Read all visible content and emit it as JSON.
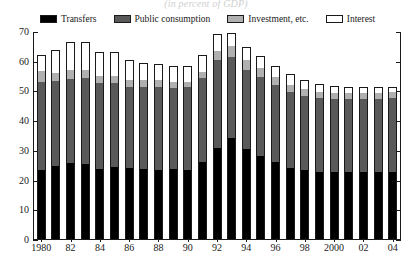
{
  "chart_data": {
    "type": "bar",
    "stacked": true,
    "title": "(in percent of GDP)",
    "xlabel": "",
    "ylabel": "",
    "ylim": [
      0,
      70
    ],
    "yticks": [
      0,
      10,
      20,
      30,
      40,
      50,
      60,
      70
    ],
    "ytick_labels": [
      "0",
      "10",
      "20",
      "30",
      "40",
      "50",
      "60",
      "70"
    ],
    "grid": false,
    "legend_position": "top",
    "categories": [
      "1980",
      "1981",
      "1982",
      "1983",
      "1984",
      "1985",
      "1986",
      "1987",
      "1988",
      "1989",
      "1990",
      "1991",
      "1992",
      "1993",
      "1994",
      "1995",
      "1996",
      "1997",
      "1998",
      "1999",
      "2000",
      "2001",
      "2002",
      "2003",
      "2004"
    ],
    "xtick_labels": [
      {
        "label": "1980",
        "category": "1980"
      },
      {
        "label": "82",
        "category": "1982"
      },
      {
        "label": "84",
        "category": "1984"
      },
      {
        "label": "86",
        "category": "1986"
      },
      {
        "label": "88",
        "category": "1988"
      },
      {
        "label": "90",
        "category": "1990"
      },
      {
        "label": "92",
        "category": "1992"
      },
      {
        "label": "94",
        "category": "1994"
      },
      {
        "label": "96",
        "category": "1996"
      },
      {
        "label": "98",
        "category": "1998"
      },
      {
        "label": "2000",
        "category": "2000"
      },
      {
        "label": "02",
        "category": "2002"
      },
      {
        "label": "04",
        "category": "2004"
      }
    ],
    "series": [
      {
        "name": "Transfers",
        "color": "#000000",
        "values": [
          23.2,
          24.6,
          25.6,
          25.2,
          23.6,
          24.2,
          24.0,
          23.4,
          23.2,
          23.4,
          23.2,
          25.8,
          30.6,
          34.0,
          30.2,
          28.0,
          25.8,
          24.0,
          23.2,
          22.6,
          22.6,
          22.6,
          22.6,
          22.6,
          22.6
        ]
      },
      {
        "name": "Public consumption",
        "color": "#595959",
        "values": [
          29.8,
          28.6,
          28.4,
          29.0,
          29.0,
          28.2,
          27.2,
          27.6,
          27.8,
          27.4,
          27.8,
          28.4,
          29.6,
          27.4,
          26.8,
          26.4,
          26.0,
          25.4,
          25.0,
          24.8,
          24.4,
          24.4,
          24.6,
          24.6,
          24.8
        ]
      },
      {
        "name": "Investment, etc.",
        "color": "#b0b0b0",
        "values": [
          3.4,
          2.8,
          3.0,
          2.6,
          2.4,
          2.4,
          2.4,
          2.6,
          2.4,
          2.2,
          2.0,
          2.0,
          3.2,
          3.4,
          3.2,
          3.0,
          2.6,
          2.4,
          2.2,
          2.0,
          2.0,
          2.0,
          2.0,
          2.0,
          2.0
        ]
      },
      {
        "name": "Interest",
        "color": "#ffffff",
        "values": [
          5.4,
          7.6,
          9.2,
          9.4,
          7.8,
          8.0,
          6.6,
          5.6,
          5.6,
          5.4,
          5.4,
          5.8,
          5.6,
          4.6,
          4.4,
          4.2,
          4.0,
          3.8,
          3.2,
          2.8,
          2.4,
          2.2,
          2.0,
          1.8,
          1.8
        ]
      }
    ],
    "legend": [
      {
        "label": "Transfers",
        "color": "#000000"
      },
      {
        "label": "Public consumption",
        "color": "#595959"
      },
      {
        "label": "Investment, etc.",
        "color": "#b0b0b0"
      },
      {
        "label": "Interest",
        "color": "#ffffff"
      }
    ]
  }
}
